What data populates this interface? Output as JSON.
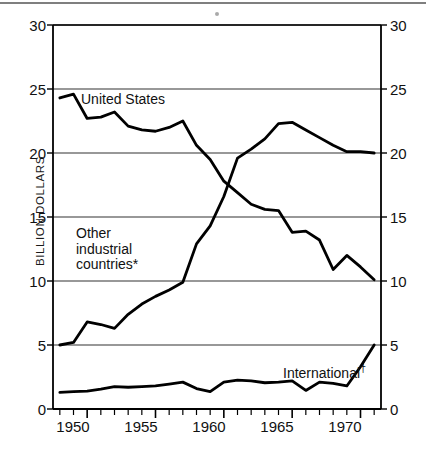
{
  "chart_data": {
    "type": "line",
    "title": "",
    "subtitle": "",
    "xlabel": "",
    "ylabel": "BILLION DOLLARS",
    "xlim": [
      1947.5,
      1971.5
    ],
    "ylim": [
      0,
      30
    ],
    "grid": "horizontal",
    "legend": "inline-annotations",
    "y_ticks": [
      0,
      5,
      10,
      15,
      20,
      25,
      30
    ],
    "y_tick_labels": [
      "0",
      "5",
      "10",
      "15",
      "20",
      "25",
      "30"
    ],
    "y_ticks_right": [
      0,
      5,
      10,
      15,
      20,
      25,
      30
    ],
    "y_tick_labels_right": [
      "0",
      "5",
      "10",
      "15",
      "20",
      "25",
      "30"
    ],
    "x_ticks": [
      1948,
      1949,
      1950,
      1951,
      1952,
      1953,
      1954,
      1955,
      1956,
      1957,
      1958,
      1959,
      1960,
      1961,
      1962,
      1963,
      1964,
      1965,
      1966,
      1967,
      1968,
      1969,
      1970,
      1971
    ],
    "x_tick_labels_shown": [
      "1950",
      "1955",
      "1960",
      "1965",
      "1970"
    ],
    "x_labeled_positions": [
      1950,
      1955,
      1960,
      1965,
      1970
    ],
    "x": [
      1948,
      1949,
      1950,
      1951,
      1952,
      1953,
      1954,
      1955,
      1956,
      1957,
      1958,
      1959,
      1960,
      1961,
      1962,
      1963,
      1964,
      1965,
      1966,
      1967,
      1968,
      1969,
      1970,
      1971
    ],
    "series": [
      {
        "name": "United States",
        "label": "United States",
        "values": [
          24.3,
          24.6,
          22.7,
          22.8,
          23.2,
          22.1,
          21.8,
          21.7,
          22.0,
          22.5,
          20.6,
          19.5,
          17.8,
          16.9,
          16.0,
          15.6,
          15.5,
          13.8,
          13.9,
          13.2,
          10.9,
          12.0,
          11.1,
          10.1
        ],
        "color": "#000000"
      },
      {
        "name": "Other industrial countries",
        "label": "Other\nindustrial\ncountries*",
        "label_lines": [
          "Other",
          "industrial",
          "countries*"
        ],
        "values": [
          5.0,
          5.2,
          6.8,
          6.6,
          6.3,
          7.4,
          8.2,
          8.8,
          9.3,
          9.9,
          12.9,
          14.3,
          16.6,
          19.6,
          20.3,
          21.1,
          22.3,
          22.4,
          21.8,
          21.2,
          20.6,
          20.1,
          20.1,
          20.0
        ],
        "color": "#000000"
      },
      {
        "name": "International",
        "label": "International†",
        "values": [
          1.3,
          1.35,
          1.4,
          1.55,
          1.75,
          1.7,
          1.75,
          1.8,
          1.95,
          2.1,
          1.6,
          1.35,
          2.1,
          2.25,
          2.2,
          2.05,
          2.1,
          2.2,
          1.45,
          2.1,
          2.0,
          1.8,
          3.3,
          5.0
        ],
        "color": "#000000"
      }
    ],
    "annotations": [
      {
        "text": "United States",
        "x": 1950.6,
        "y": 24.0
      },
      {
        "text": "Other industrial countries*",
        "x": 1949.6,
        "y": 13.6
      },
      {
        "text": "International†",
        "x": 1964.6,
        "y": 3.9
      }
    ],
    "footnote_markers": [
      "*",
      "†"
    ]
  },
  "axes": {
    "y_label": "BILLION DOLLARS",
    "left_ticks": [
      "30",
      "25",
      "20",
      "15",
      "10",
      "5",
      "0"
    ],
    "right_ticks": [
      "30",
      "25",
      "20",
      "15",
      "10",
      "5",
      "0"
    ],
    "x_labels": [
      "1950",
      "1955",
      "1960",
      "1965",
      "1970"
    ]
  },
  "labels": {
    "united_states": "United States",
    "other_line1": "Other",
    "other_line2": "industrial",
    "other_line3": "countries*",
    "international": "International",
    "international_dagger": "†"
  },
  "colors": {
    "line": "#000000",
    "grid": "#333333",
    "axis": "#000000",
    "background": "#ffffff",
    "text": "#111111"
  }
}
